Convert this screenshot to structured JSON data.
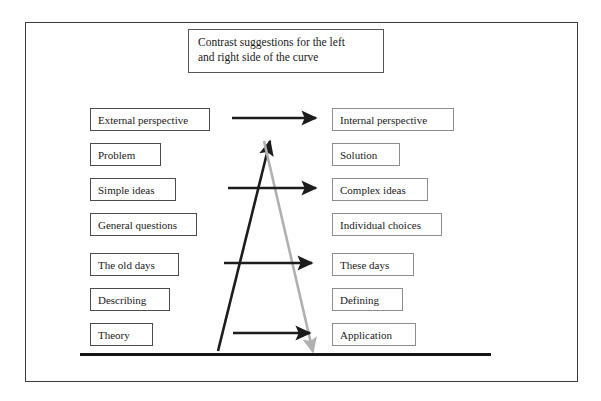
{
  "diagram": {
    "title_box": {
      "lines": [
        "Contrast suggestions for the left",
        "and right side of the curve"
      ]
    },
    "left_column": {
      "heading": "Left side of the curve",
      "items": [
        {
          "label": "External perspective",
          "top": 108,
          "width": 120
        },
        {
          "label": "Problem",
          "top": 143,
          "width": 71
        },
        {
          "label": "Simple ideas",
          "top": 178,
          "width": 86
        },
        {
          "label": "General questions",
          "top": 213,
          "width": 107
        },
        {
          "label": "The old days",
          "top": 253,
          "width": 89
        },
        {
          "label": "Describing",
          "top": 288,
          "width": 80
        },
        {
          "label": "Theory",
          "top": 323,
          "width": 63
        }
      ]
    },
    "right_column": {
      "heading": "Right side of the curve",
      "items": [
        {
          "label": "Internal perspective",
          "top": 108,
          "width": 122
        },
        {
          "label": "Solution",
          "top": 143,
          "width": 68
        },
        {
          "label": "Complex ideas",
          "top": 178,
          "width": 96
        },
        {
          "label": "Individual choices",
          "top": 213,
          "width": 110
        },
        {
          "label": "These days",
          "top": 253,
          "width": 82
        },
        {
          "label": "Defining",
          "top": 288,
          "width": 71
        },
        {
          "label": "Application",
          "top": 323,
          "width": 84
        }
      ]
    },
    "curve": {
      "ascending_arrow": {
        "name": "ascending-curve-arrow",
        "color": "#1c1c1c",
        "from": {
          "x": 218,
          "y": 351
        },
        "to": {
          "x": 270,
          "y": 141
        }
      },
      "descending_arrow": {
        "name": "descending-curve-arrow",
        "color": "#b0b0b0",
        "from": {
          "x": 264,
          "y": 141
        },
        "to": {
          "x": 313,
          "y": 352
        }
      },
      "apex": {
        "x": 267,
        "y": 141
      }
    },
    "contrast_arrows": [
      {
        "name": "contrast-arrow-1",
        "y": 118,
        "x1": 232,
        "x2": 316,
        "color": "#1c1c1c"
      },
      {
        "name": "contrast-arrow-2",
        "y": 188,
        "x1": 228,
        "x2": 316,
        "color": "#1c1c1c"
      },
      {
        "name": "contrast-arrow-3",
        "y": 263,
        "x1": 224,
        "x2": 312,
        "color": "#1c1c1c"
      },
      {
        "name": "contrast-arrow-4",
        "y": 333,
        "x1": 233,
        "x2": 310,
        "color": "#1c1c1c"
      }
    ],
    "baseline": {
      "name": "baseline-rule",
      "color": "#151515",
      "x1": 80,
      "x2": 491,
      "y": 354
    },
    "colors": {
      "frame_border": "#3a3a3a",
      "left_box_border": "#4b4b4b",
      "right_box_border": "#8d8d8d",
      "text": "#1a1a1a",
      "dark_arrow": "#1c1c1c",
      "gray_arrow": "#b0b0b0",
      "background": "#ffffff"
    }
  }
}
